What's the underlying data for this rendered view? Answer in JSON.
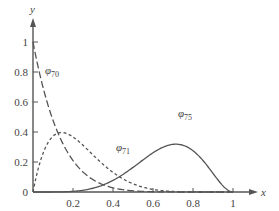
{
  "chart_data": {
    "type": "line",
    "title": "",
    "xlabel": "x",
    "ylabel": "y",
    "xlim": [
      0,
      1
    ],
    "ylim": [
      0,
      1
    ],
    "x_ticks": [
      "0.2",
      "0.4",
      "0.6",
      "0.8",
      "1"
    ],
    "y_ticks": [
      "0",
      "0.2",
      "0.4",
      "0.6",
      "0.8",
      "1"
    ],
    "grid": false,
    "series": [
      {
        "name": "φ70",
        "label_main": "φ",
        "label_sub": "70",
        "style": "long-dash",
        "formula": "(1-x)^7",
        "x": [
          0,
          0.1,
          0.2,
          0.3,
          0.4,
          0.5,
          0.6,
          0.7,
          0.8,
          0.9,
          1
        ],
        "values": [
          1,
          0.478,
          0.21,
          0.082,
          0.028,
          0.008,
          0.002,
          0,
          0,
          0,
          0
        ]
      },
      {
        "name": "φ71",
        "label_main": "φ",
        "label_sub": "71",
        "style": "short-dash",
        "formula": "7x(1-x)^6",
        "x": [
          0,
          0.1,
          0.143,
          0.2,
          0.3,
          0.4,
          0.5,
          0.6,
          0.7,
          0.8,
          0.9,
          1
        ],
        "values": [
          0,
          0.372,
          0.397,
          0.367,
          0.247,
          0.131,
          0.055,
          0.017,
          0.004,
          0,
          0,
          0
        ]
      },
      {
        "name": "φ75",
        "label_main": "φ",
        "label_sub": "75",
        "style": "solid",
        "formula": "21x^5(1-x)^2",
        "x": [
          0,
          0.2,
          0.3,
          0.4,
          0.5,
          0.6,
          0.7,
          0.714,
          0.8,
          0.9,
          1
        ],
        "values": [
          0,
          0.004,
          0.025,
          0.077,
          0.164,
          0.261,
          0.318,
          0.319,
          0.275,
          0.124,
          0
        ]
      }
    ]
  }
}
